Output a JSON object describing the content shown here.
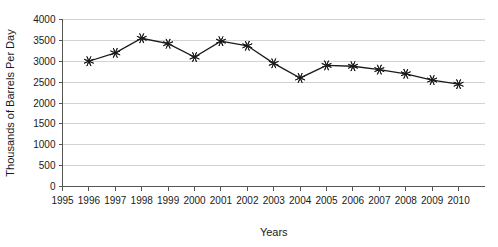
{
  "chart_data": {
    "type": "line",
    "title": "",
    "xlabel": "Years",
    "ylabel": "Thousands of Barrels Per Day",
    "x": [
      1996,
      1997,
      1998,
      1999,
      2000,
      2001,
      2002,
      2003,
      2004,
      2005,
      2006,
      2007,
      2008,
      2009,
      2010
    ],
    "values": [
      3000,
      3200,
      3550,
      3420,
      3100,
      3480,
      3370,
      2950,
      2600,
      2900,
      2880,
      2800,
      2700,
      2550,
      2450
    ],
    "series": [
      {
        "name": "Production",
        "values": [
          3000,
          3200,
          3550,
          3420,
          3100,
          3480,
          3370,
          2950,
          2600,
          2900,
          2880,
          2800,
          2700,
          2550,
          2450
        ]
      }
    ],
    "xticks": [
      "1995",
      "1996",
      "1997",
      "1998",
      "1999",
      "2000",
      "2001",
      "2002",
      "2003",
      "2004",
      "2005",
      "2006",
      "2007",
      "2008",
      "2009",
      "2010"
    ],
    "xtick_values": [
      1995,
      1996,
      1997,
      1998,
      1999,
      2000,
      2001,
      2002,
      2003,
      2004,
      2005,
      2006,
      2007,
      2008,
      2009,
      2010
    ],
    "yticks": [
      "0",
      "500",
      "1000",
      "1500",
      "2000",
      "2500",
      "3000",
      "3500",
      "4000"
    ],
    "ytick_values": [
      0,
      500,
      1000,
      1500,
      2000,
      2500,
      3000,
      3500,
      4000
    ],
    "xlim": [
      1995,
      2010.8
    ],
    "ylim": [
      0,
      4000
    ],
    "grid": "horizontal",
    "legend": "none",
    "marker": "asterisk",
    "line_color": "#1a1a1a",
    "grid_color": "#c8c8c8",
    "axis_color": "#555555",
    "background": "#ffffff"
  }
}
